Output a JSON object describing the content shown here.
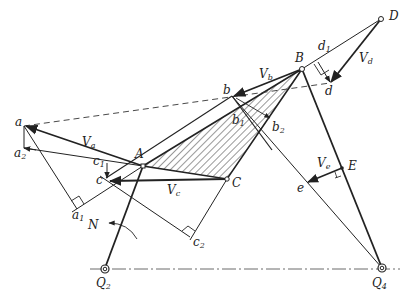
{
  "diagram": {
    "points": {
      "D": {
        "label": "D",
        "sub": ""
      },
      "B": {
        "label": "B",
        "sub": ""
      },
      "A": {
        "label": "A",
        "sub": ""
      },
      "C": {
        "label": "C",
        "sub": ""
      },
      "E": {
        "label": "E",
        "sub": ""
      },
      "Q2": {
        "label": "Q",
        "sub": "2"
      },
      "Q4": {
        "label": "Q",
        "sub": "4"
      },
      "a": {
        "label": "a",
        "sub": ""
      },
      "a1": {
        "label": "a",
        "sub": "1"
      },
      "a2": {
        "label": "a",
        "sub": "2"
      },
      "b": {
        "label": "b",
        "sub": ""
      },
      "b1": {
        "label": "b",
        "sub": "1"
      },
      "b2": {
        "label": "b",
        "sub": "2"
      },
      "c": {
        "label": "c",
        "sub": ""
      },
      "c1": {
        "label": "c",
        "sub": "1"
      },
      "c2": {
        "label": "c",
        "sub": "2"
      },
      "d": {
        "label": "d",
        "sub": ""
      },
      "d1": {
        "label": "d",
        "sub": "1"
      },
      "e": {
        "label": "e",
        "sub": ""
      },
      "N": {
        "label": "N",
        "sub": ""
      }
    },
    "vectors": {
      "Va": {
        "label": "V",
        "sub": "a"
      },
      "Vb": {
        "label": "V",
        "sub": "b"
      },
      "Vc": {
        "label": "V",
        "sub": "c"
      },
      "Vd": {
        "label": "V",
        "sub": "d"
      },
      "Ve": {
        "label": "V",
        "sub": "e"
      }
    },
    "colors": {
      "stroke": "#222222",
      "hatch": "#333333",
      "background": "#ffffff"
    }
  }
}
